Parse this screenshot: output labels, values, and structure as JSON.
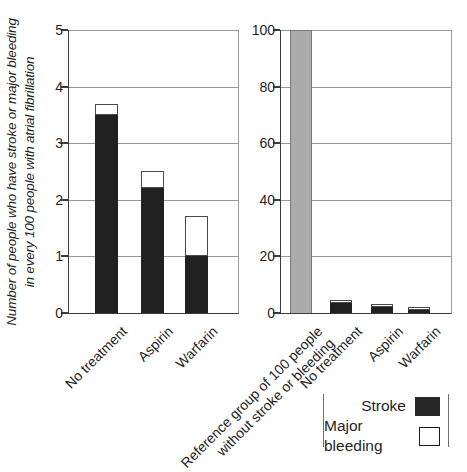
{
  "colors": {
    "stroke_fill": "#212121",
    "major_bleeding_fill": "#ffffff",
    "major_bleeding_border": "#4a4a4a",
    "reference_fill": "#ababab",
    "reference_border": "#787878",
    "gridline": "#989898",
    "axis": "#3c3c3c"
  },
  "legend": {
    "items": [
      {
        "label": "Stroke",
        "swatch": "stroke"
      },
      {
        "label": "Major bleeding",
        "swatch": "major-bleeding"
      }
    ]
  },
  "chart_data": [
    {
      "type": "bar",
      "stacked": true,
      "title": "",
      "ylabel": "Number of people who have stroke or major bleeding\nin every 100 people with atrial fibrillation",
      "ylim": [
        0,
        5
      ],
      "yticks": [
        0,
        1,
        2,
        3,
        4,
        5
      ],
      "grid": true,
      "categories": [
        "No treatment",
        "Aspirin",
        "Warfarin"
      ],
      "series": [
        {
          "name": "Stroke",
          "values": [
            3.5,
            2.2,
            1.0
          ]
        },
        {
          "name": "Major bleeding",
          "values": [
            0.2,
            0.3,
            0.7
          ]
        }
      ]
    },
    {
      "type": "bar",
      "stacked": true,
      "title": "",
      "ylabel": "",
      "ylim": [
        0,
        100
      ],
      "yticks": [
        0,
        20,
        40,
        60,
        80,
        100
      ],
      "grid": true,
      "categories": [
        "Reference group of 100 people\nwithout stroke or bleeding",
        "No treatment",
        "Aspirin",
        "Warfarin"
      ],
      "series": [
        {
          "name": "Reference",
          "values": [
            100,
            null,
            null,
            null
          ]
        },
        {
          "name": "Stroke",
          "values": [
            null,
            3.5,
            2.2,
            1.0
          ]
        },
        {
          "name": "Major bleeding",
          "values": [
            null,
            0.2,
            0.3,
            0.7
          ]
        }
      ]
    }
  ]
}
